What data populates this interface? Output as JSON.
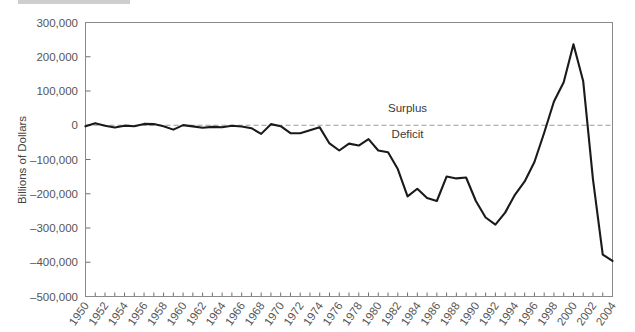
{
  "chart_data": {
    "type": "line",
    "title": "",
    "subtitle": "",
    "xlabel": "",
    "ylabel": "Billions of Dollars",
    "xlim": [
      1950,
      2004
    ],
    "ylim": [
      -500000,
      300000
    ],
    "grid": false,
    "legend": null,
    "y_tick_labels": [
      "300,000",
      "200,000",
      "100,000",
      "0",
      "–100,000",
      "–200,000",
      "–300,000",
      "–400,000",
      "–500,000"
    ],
    "y_tick_values": [
      300000,
      200000,
      100000,
      0,
      -100000,
      -200000,
      -300000,
      -400000,
      -500000
    ],
    "x_tick_labels": [
      "1950",
      "1952",
      "1954",
      "1956",
      "1958",
      "1960",
      "1962",
      "1964",
      "1966",
      "1968",
      "1970",
      "1972",
      "1974",
      "1976",
      "1978",
      "1980",
      "1982",
      "1984",
      "1986",
      "1988",
      "1990",
      "1992",
      "1994",
      "1996",
      "1998",
      "2000",
      "2002",
      "2004"
    ],
    "x_tick_values": [
      1950,
      1952,
      1954,
      1956,
      1958,
      1960,
      1962,
      1964,
      1966,
      1968,
      1970,
      1972,
      1974,
      1976,
      1978,
      1980,
      1982,
      1984,
      1986,
      1988,
      1990,
      1992,
      1994,
      1996,
      1998,
      2000,
      2002,
      2004
    ],
    "x": [
      1950,
      1951,
      1952,
      1953,
      1954,
      1955,
      1956,
      1957,
      1958,
      1959,
      1960,
      1961,
      1962,
      1963,
      1964,
      1965,
      1966,
      1967,
      1968,
      1969,
      1970,
      1971,
      1972,
      1973,
      1974,
      1975,
      1976,
      1977,
      1978,
      1979,
      1980,
      1981,
      1982,
      1983,
      1984,
      1985,
      1986,
      1987,
      1988,
      1989,
      1990,
      1991,
      1992,
      1993,
      1994,
      1995,
      1996,
      1997,
      1998,
      1999,
      2000,
      2001,
      2002,
      2003,
      2004
    ],
    "values": [
      -3100,
      6100,
      -1500,
      -6500,
      -1200,
      -3000,
      3900,
      3400,
      -2800,
      -12800,
      300,
      -3300,
      -7100,
      -4800,
      -5900,
      -1400,
      -3700,
      -8600,
      -25200,
      3200,
      -2800,
      -23000,
      -23400,
      -14900,
      -6100,
      -53200,
      -73700,
      -53700,
      -59200,
      -40700,
      -73800,
      -79000,
      -128000,
      -207800,
      -185400,
      -212300,
      -221200,
      -149700,
      -155200,
      -152500,
      -221200,
      -269300,
      -290300,
      -255100,
      -203200,
      -164000,
      -107400,
      -21900,
      69300,
      125600,
      236200,
      128200,
      -157800,
      -377600,
      -396000
    ],
    "annotations": [
      {
        "text": "Surplus",
        "x": 1983,
        "y": 40000
      },
      {
        "text": "Deficit",
        "x": 1983,
        "y": -38000
      }
    ],
    "reference_line": {
      "y": 0,
      "style": "dashed",
      "color": "#9a9a9a"
    },
    "line_color": "#1a1a1a",
    "line_width": 2.1
  },
  "axes": {
    "ylabel_text": "Billions of Dollars"
  }
}
